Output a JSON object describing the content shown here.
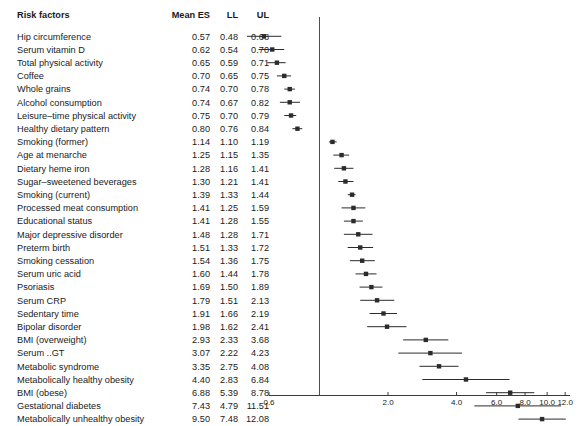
{
  "table": {
    "headers": {
      "risk_factors": "Risk factors",
      "mean_es": "Mean ES",
      "ll": "LL",
      "ul": "UL"
    },
    "rows": [
      {
        "label": "Hip circumference",
        "mean": "0.57",
        "ll": "0.48",
        "ul": "0.68"
      },
      {
        "label": "Serum vitamin D",
        "mean": "0.62",
        "ll": "0.54",
        "ul": "0.70"
      },
      {
        "label": "Total physical activity",
        "mean": "0.65",
        "ll": "0.59",
        "ul": "0.71"
      },
      {
        "label": "Coffee",
        "mean": "0.70",
        "ll": "0.65",
        "ul": "0.75"
      },
      {
        "label": "Whole grains",
        "mean": "0.74",
        "ll": "0.70",
        "ul": "0.78"
      },
      {
        "label": "Alcohol consumption",
        "mean": "0.74",
        "ll": "0.67",
        "ul": "0.82"
      },
      {
        "label": "Leisure–time physical activity",
        "mean": "0.75",
        "ll": "0.70",
        "ul": "0.79"
      },
      {
        "label": "Healthy dietary pattern",
        "mean": "0.80",
        "ll": "0.76",
        "ul": "0.84"
      },
      {
        "label": "Smoking (former)",
        "mean": "1.14",
        "ll": "1.10",
        "ul": "1.19"
      },
      {
        "label": "Age at menarche",
        "mean": "1.25",
        "ll": "1.15",
        "ul": "1.35"
      },
      {
        "label": "Dietary heme iron",
        "mean": "1.28",
        "ll": "1.16",
        "ul": "1.41"
      },
      {
        "label": "Sugar–sweetened beverages",
        "mean": "1.30",
        "ll": "1.21",
        "ul": "1.41"
      },
      {
        "label": "Smoking (current)",
        "mean": "1.39",
        "ll": "1.33",
        "ul": "1.44"
      },
      {
        "label": "Processed meat consumption",
        "mean": "1.41",
        "ll": "1.25",
        "ul": "1.59"
      },
      {
        "label": "Educational status",
        "mean": "1.41",
        "ll": "1.28",
        "ul": "1.55"
      },
      {
        "label": "Major depressive disorder",
        "mean": "1.48",
        "ll": "1.28",
        "ul": "1.71"
      },
      {
        "label": "Preterm birth",
        "mean": "1.51",
        "ll": "1.33",
        "ul": "1.72"
      },
      {
        "label": "Smoking cessation",
        "mean": "1.54",
        "ll": "1.36",
        "ul": "1.75"
      },
      {
        "label": "Serum uric acid",
        "mean": "1.60",
        "ll": "1.44",
        "ul": "1.78"
      },
      {
        "label": "Psoriasis",
        "mean": "1.69",
        "ll": "1.50",
        "ul": "1.89"
      },
      {
        "label": "Serum CRP",
        "mean": "1.79",
        "ll": "1.51",
        "ul": "2.13"
      },
      {
        "label": "Sedentary time",
        "mean": "1.91",
        "ll": "1.66",
        "ul": "2.19"
      },
      {
        "label": "Bipolar disorder",
        "mean": "1.98",
        "ll": "1.62",
        "ul": "2.41"
      },
      {
        "label": "BMI (overweight)",
        "mean": "2.93",
        "ll": "2.33",
        "ul": "3.68"
      },
      {
        "label": "Serum ..GT",
        "mean": "3.07",
        "ll": "2.22",
        "ul": "4.23"
      },
      {
        "label": "Metabolic syndrome",
        "mean": "3.35",
        "ll": "2.75",
        "ul": "4.08"
      },
      {
        "label": "Metabolically healthy obesity",
        "mean": "4.40",
        "ll": "2.83",
        "ul": "6.84"
      },
      {
        "label": "BMI (obese)",
        "mean": "6.88",
        "ll": "5.39",
        "ul": "8.78"
      },
      {
        "label": "Gestational diabetes",
        "mean": "7.43",
        "ll": "4.79",
        "ul": "11.51"
      },
      {
        "label": "Metabolically unhealthy obesity",
        "mean": "9.50",
        "ll": "7.48",
        "ul": "12.08"
      }
    ]
  },
  "chart_data": {
    "type": "forest",
    "title": "",
    "xlabel": "",
    "ylabel": "",
    "scale": "log",
    "xlim": [
      0.6,
      12.6
    ],
    "grid": false,
    "reference_line": 1.0,
    "legend": "none",
    "tick_values": [
      0.6,
      2.0,
      4.0,
      6.0,
      8.0,
      10.0,
      12.0
    ],
    "tick_labels": [
      "0.6",
      "2.0",
      "4.0",
      "6.0",
      "8.0",
      "10.0",
      "12.0"
    ],
    "marker_color": "#2b2b2b",
    "line_color": "#2b2b2b",
    "axis_color": "#3a3a3a",
    "categories": [
      "Hip circumference",
      "Serum vitamin D",
      "Total physical activity",
      "Coffee",
      "Whole grains",
      "Alcohol consumption",
      "Leisure–time physical activity",
      "Healthy dietary pattern",
      "Smoking (former)",
      "Age at menarche",
      "Dietary heme iron",
      "Sugar–sweetened beverages",
      "Smoking (current)",
      "Processed meat consumption",
      "Educational status",
      "Major depressive disorder",
      "Preterm birth",
      "Smoking cessation",
      "Serum uric acid",
      "Psoriasis",
      "Serum CRP",
      "Sedentary time",
      "Bipolar disorder",
      "BMI (overweight)",
      "Serum ..GT",
      "Metabolic syndrome",
      "Metabolically healthy obesity",
      "BMI (obese)",
      "Gestational diabetes",
      "Metabolically unhealthy obesity"
    ],
    "estimates": [
      0.57,
      0.62,
      0.65,
      0.7,
      0.74,
      0.74,
      0.75,
      0.8,
      1.14,
      1.25,
      1.28,
      1.3,
      1.39,
      1.41,
      1.41,
      1.48,
      1.51,
      1.54,
      1.6,
      1.69,
      1.79,
      1.91,
      1.98,
      2.93,
      3.07,
      3.35,
      4.4,
      6.88,
      7.43,
      9.5
    ],
    "lower": [
      0.48,
      0.54,
      0.59,
      0.65,
      0.7,
      0.67,
      0.7,
      0.76,
      1.1,
      1.15,
      1.16,
      1.21,
      1.33,
      1.25,
      1.28,
      1.28,
      1.33,
      1.36,
      1.44,
      1.5,
      1.51,
      1.66,
      1.62,
      2.33,
      2.22,
      2.75,
      2.83,
      5.39,
      4.79,
      7.48
    ],
    "upper": [
      0.68,
      0.7,
      0.71,
      0.75,
      0.78,
      0.82,
      0.79,
      0.84,
      1.19,
      1.35,
      1.41,
      1.41,
      1.44,
      1.59,
      1.55,
      1.71,
      1.72,
      1.75,
      1.78,
      1.89,
      2.13,
      2.19,
      2.41,
      3.68,
      4.23,
      4.08,
      6.84,
      8.78,
      11.51,
      12.08
    ]
  }
}
